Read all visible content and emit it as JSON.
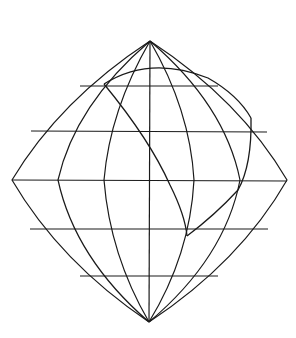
{
  "diagram": {
    "type": "map-projection-graticule",
    "colors": {
      "line": "#1a1a1a",
      "background": "#ffffff"
    },
    "poles": {
      "north": [
        150,
        41
      ],
      "south": [
        149,
        322
      ]
    },
    "equator_y": 180,
    "parallels": [
      {
        "y": 86,
        "x1": 80,
        "x2": 218
      },
      {
        "y": 131,
        "x1": 31,
        "x2": 267
      },
      {
        "y": 180,
        "x1": 12,
        "x2": 287
      },
      {
        "y": 229,
        "x1": 30,
        "x2": 268
      },
      {
        "y": 276,
        "x1": 80,
        "x2": 218
      }
    ],
    "meridians_equator_x": [
      12,
      58,
      104,
      149,
      194,
      240,
      287
    ],
    "polygon": {
      "vertices": [
        [
          104,
          84
        ],
        [
          251,
          118
        ],
        [
          187,
          236
        ]
      ],
      "note": "spherical triangle drawn with curved edges"
    }
  }
}
